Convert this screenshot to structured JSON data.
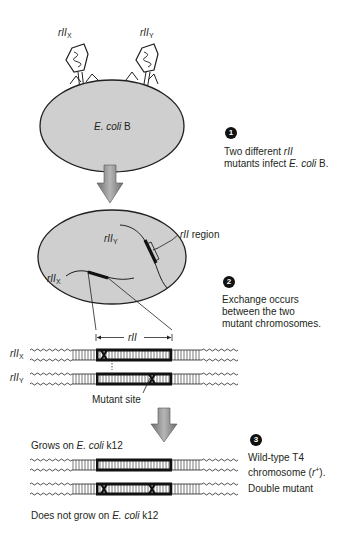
{
  "phages": {
    "left_label": "rII",
    "left_sub": "X",
    "right_label": "rII",
    "right_sub": "Y"
  },
  "cell1": {
    "label_italic": "E. coli",
    "label_rest": " B"
  },
  "cell2": {
    "chrom_y_label": "rII",
    "chrom_y_sub": "Y",
    "chrom_x_label": "rII",
    "chrom_x_sub": "X",
    "region_label_italic": "rII",
    "region_label_rest": " region"
  },
  "steps": [
    {
      "number": "1",
      "line1": "Two different ",
      "line1_italic": "rII",
      "line2": "mutants infect ",
      "line2_italic": "E. coli",
      "line2_rest": " B."
    },
    {
      "number": "2",
      "line1": "Exchange occurs",
      "line2": "between the two",
      "line3": "mutant chromosomes."
    },
    {
      "number": "3",
      "line1": "Wild-type T4",
      "line2_pre": "chromosome (",
      "line2_italic": "r",
      "line2_sup": "+",
      "line2_post": ")."
    }
  ],
  "exchange": {
    "span_label": "rII",
    "top_label": "rII",
    "top_sub": "X",
    "bottom_label": "rII",
    "bottom_sub": "Y",
    "mutant_site_label": "Mutant site"
  },
  "results": {
    "grows_pre": "Grows on ",
    "grows_italic": "E. coli",
    "grows_post": " k12",
    "double_mutant_label": "Double mutant",
    "not_grow_pre": "Does not grow on ",
    "not_grow_italic": "E. coli",
    "not_grow_post": " k12"
  },
  "colors": {
    "cell_fill": "#cfcfcf",
    "outline": "#231f20",
    "arrow_fill": "#8a8a8a"
  }
}
